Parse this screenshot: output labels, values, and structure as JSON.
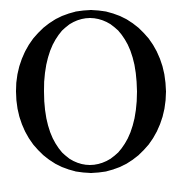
{
  "glyph": {
    "character": "O",
    "color": "#000000",
    "background": "#ffffff"
  }
}
